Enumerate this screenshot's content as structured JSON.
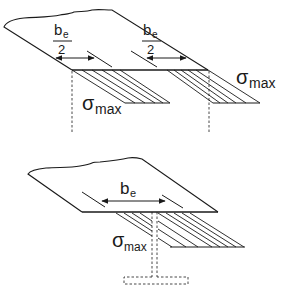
{
  "diagram": {
    "colors": {
      "stroke": "#1a1a1a",
      "background": "#ffffff"
    },
    "top_figure": {
      "labels": {
        "left_width_numerator": "b",
        "left_width_subscript": "e",
        "left_width_denominator": "2",
        "right_width_numerator": "b",
        "right_width_subscript": "e",
        "right_width_denominator": "2",
        "left_stress_main": "σ",
        "left_stress_subscript": "max",
        "right_stress_main": "σ",
        "right_stress_subscript": "max"
      }
    },
    "bottom_figure": {
      "labels": {
        "width_main": "b",
        "width_subscript": "e",
        "stress_main": "σ",
        "stress_subscript": "max"
      }
    }
  }
}
